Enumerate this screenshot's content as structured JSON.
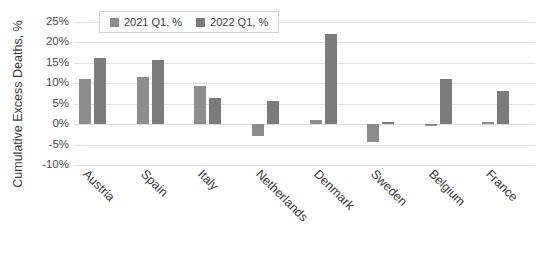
{
  "chart_data": {
    "type": "bar",
    "title": "",
    "xlabel": "",
    "ylabel": "Cumulative Excess Deaths, %",
    "ylim": [
      -10,
      25
    ],
    "ytick_labels": [
      "25%",
      "20%",
      "15%",
      "10%",
      "5%",
      "0%",
      "-5%",
      "-10%"
    ],
    "ytick_values": [
      25,
      20,
      15,
      10,
      5,
      0,
      -5,
      -10
    ],
    "grid": true,
    "legend_position": "top-left-inside",
    "categories": [
      "Austria",
      "Spain",
      "Italy",
      "Netherlands",
      "Denmark",
      "Sweden",
      "Belgium",
      "France"
    ],
    "series": [
      {
        "name": "2021 Q1, %",
        "color": "#8d8d8d",
        "values": [
          11.0,
          11.6,
          9.3,
          -2.8,
          0.9,
          -4.3,
          -0.4,
          0.6
        ]
      },
      {
        "name": "2022 Q1, %",
        "color": "#7b7b7b",
        "values": [
          16.2,
          15.8,
          6.3,
          5.6,
          22.0,
          0.6,
          11.0,
          8.0
        ]
      }
    ]
  },
  "legend": {
    "items": [
      {
        "label": "2021 Q1, %"
      },
      {
        "label": "2022 Q1, %"
      }
    ]
  },
  "axis": {
    "y_title": "Cumulative Excess Deaths, %"
  },
  "colors": {
    "series_2021": "#8d8d8d",
    "series_2022": "#7b7b7b",
    "gridline": "#e2e2e2",
    "background": "#ffffff",
    "text": "#3d3d3d"
  }
}
